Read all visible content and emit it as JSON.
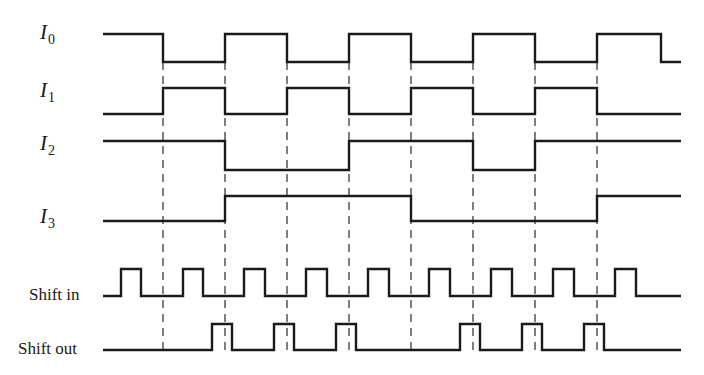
{
  "diagram": {
    "title": "",
    "colors": {
      "stroke": "#1a1a1a",
      "background": "#ffffff"
    },
    "signals": [
      {
        "id": "I0",
        "letter": "I",
        "sub": "0",
        "label_x": 40,
        "label_y": 8,
        "high_y": 34,
        "low_y": 62,
        "start_x": 103,
        "end_x": 681,
        "initial": 1,
        "transitions": [
          163,
          225,
          287,
          349,
          411,
          473,
          535,
          597,
          661
        ]
      },
      {
        "id": "I1",
        "letter": "I",
        "sub": "1",
        "label_x": 40,
        "label_y": 90,
        "high_y": 88,
        "low_y": 114,
        "start_x": 103,
        "end_x": 681,
        "initial": 0,
        "transitions": [
          163,
          225,
          287,
          349,
          411,
          473,
          535,
          597
        ]
      },
      {
        "id": "I2",
        "letter": "I",
        "sub": "2",
        "label_x": 40,
        "label_y": 142,
        "high_y": 141,
        "low_y": 170,
        "start_x": 103,
        "end_x": 681,
        "initial": 1,
        "transitions": [
          225,
          349,
          473,
          535
        ]
      },
      {
        "id": "I3",
        "letter": "I",
        "sub": "3",
        "label_x": 40,
        "label_y": 200,
        "high_y": 196,
        "low_y": 221,
        "start_x": 103,
        "end_x": 681,
        "initial": 0,
        "transitions": [
          225,
          411,
          597
        ]
      },
      {
        "id": "shift_in",
        "text": "Shift in",
        "label_x": 28,
        "label_y": 284,
        "high_y": 269,
        "low_y": 296,
        "start_x": 103,
        "end_x": 681,
        "initial": 0,
        "transitions": [
          121,
          141,
          183,
          203,
          244,
          265,
          306,
          327,
          368,
          389,
          429,
          450,
          491,
          512,
          553,
          574,
          615,
          636
        ]
      },
      {
        "id": "shift_out",
        "text": "Shift out",
        "label_x": 18,
        "label_y": 338,
        "high_y": 324,
        "low_y": 350,
        "start_x": 103,
        "end_x": 681,
        "initial": 0,
        "transitions": [
          212,
          232,
          274,
          294,
          336,
          356,
          460,
          480,
          522,
          542,
          584,
          604
        ]
      }
    ],
    "guides": {
      "x": [
        163,
        225,
        287,
        349,
        411,
        473,
        535,
        597
      ],
      "y_start": 62,
      "y_end": 350,
      "style": "dashed"
    }
  },
  "labels": {
    "I0": {
      "letter": "I",
      "sub": "0"
    },
    "I1": {
      "letter": "I",
      "sub": "1"
    },
    "I2": {
      "letter": "I",
      "sub": "2"
    },
    "I3": {
      "letter": "I",
      "sub": "3"
    },
    "shift_in": "Shift in",
    "shift_out": "Shift out"
  }
}
